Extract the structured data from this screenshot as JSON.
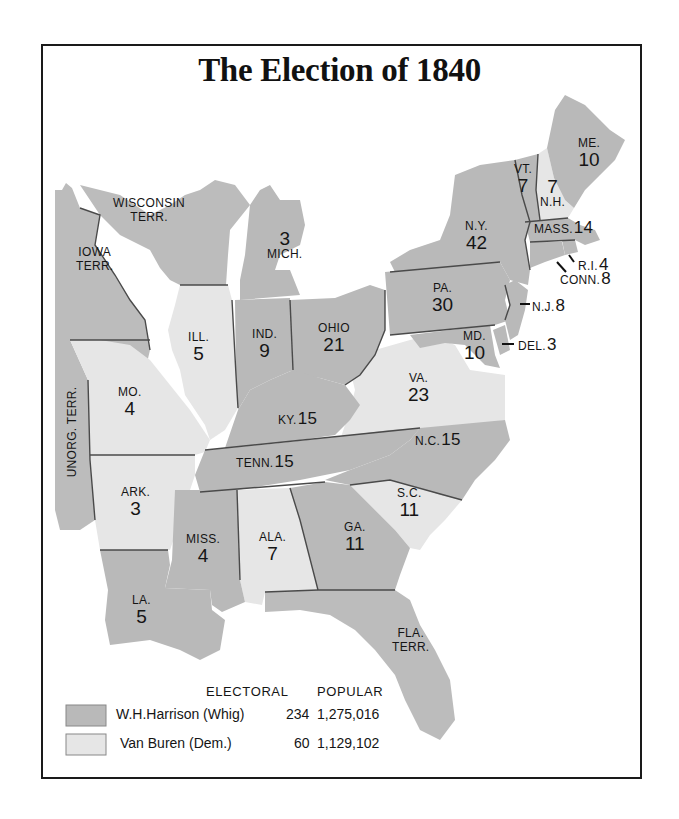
{
  "title": "The Election of 1840",
  "colors": {
    "whig": "#b9b9b9",
    "dem": "#e6e6e6",
    "territory": "#bcbcbc",
    "water": "#ffffff",
    "border": "#4a4a4a",
    "frame": "#1a1a1a"
  },
  "legend": {
    "header_electoral": "ELECTORAL",
    "header_popular": "POPULAR",
    "rows": [
      {
        "candidate": "W.H.Harrison (Whig)",
        "electoral": "234",
        "popular": "1,275,016",
        "swatch": "whig"
      },
      {
        "candidate": "Van Buren (Dem.)",
        "electoral": "60",
        "popular": "1,129,102",
        "swatch": "dem"
      }
    ]
  },
  "states": {
    "me": {
      "abbr": "ME.",
      "ev": "10",
      "party": "whig"
    },
    "vt": {
      "abbr": "VT.",
      "ev": "7",
      "party": "whig"
    },
    "nh": {
      "abbr": "N.H.",
      "ev": "7",
      "party": "dem"
    },
    "mass": {
      "abbr": "MASS.",
      "ev": "14",
      "party": "whig"
    },
    "ri": {
      "abbr": "R.I.",
      "ev": "4",
      "party": "whig"
    },
    "conn": {
      "abbr": "CONN.",
      "ev": "8",
      "party": "whig"
    },
    "ny": {
      "abbr": "N.Y.",
      "ev": "42",
      "party": "whig"
    },
    "nj": {
      "abbr": "N.J.",
      "ev": "8",
      "party": "whig"
    },
    "pa": {
      "abbr": "PA.",
      "ev": "30",
      "party": "whig"
    },
    "del": {
      "abbr": "DEL.",
      "ev": "3",
      "party": "whig"
    },
    "md": {
      "abbr": "MD.",
      "ev": "10",
      "party": "whig"
    },
    "va": {
      "abbr": "VA.",
      "ev": "23",
      "party": "dem"
    },
    "nc": {
      "abbr": "N.C.",
      "ev": "15",
      "party": "whig"
    },
    "sc": {
      "abbr": "S.C.",
      "ev": "11",
      "party": "dem"
    },
    "ga": {
      "abbr": "GA.",
      "ev": "11",
      "party": "whig"
    },
    "ohio": {
      "abbr": "OHIO",
      "ev": "21",
      "party": "whig"
    },
    "mich": {
      "abbr": "MICH.",
      "ev": "3",
      "party": "whig"
    },
    "ind": {
      "abbr": "IND.",
      "ev": "9",
      "party": "whig"
    },
    "ill": {
      "abbr": "ILL.",
      "ev": "5",
      "party": "dem"
    },
    "ky": {
      "abbr": "KY.",
      "ev": "15",
      "party": "whig"
    },
    "tenn": {
      "abbr": "TENN.",
      "ev": "15",
      "party": "whig"
    },
    "mo": {
      "abbr": "MO.",
      "ev": "4",
      "party": "dem"
    },
    "ark": {
      "abbr": "ARK.",
      "ev": "3",
      "party": "dem"
    },
    "miss": {
      "abbr": "MISS.",
      "ev": "4",
      "party": "whig"
    },
    "ala": {
      "abbr": "ALA.",
      "ev": "7",
      "party": "dem"
    },
    "la": {
      "abbr": "LA.",
      "ev": "5",
      "party": "whig"
    }
  },
  "territories": {
    "wisconsin": {
      "line1": "WISCONSIN",
      "line2": "TERR."
    },
    "iowa": {
      "line1": "IOWA",
      "line2": "TERR."
    },
    "unorg": {
      "line1": "UNORG. TERR."
    },
    "florida": {
      "line1": "FLA.",
      "line2": "TERR."
    }
  }
}
